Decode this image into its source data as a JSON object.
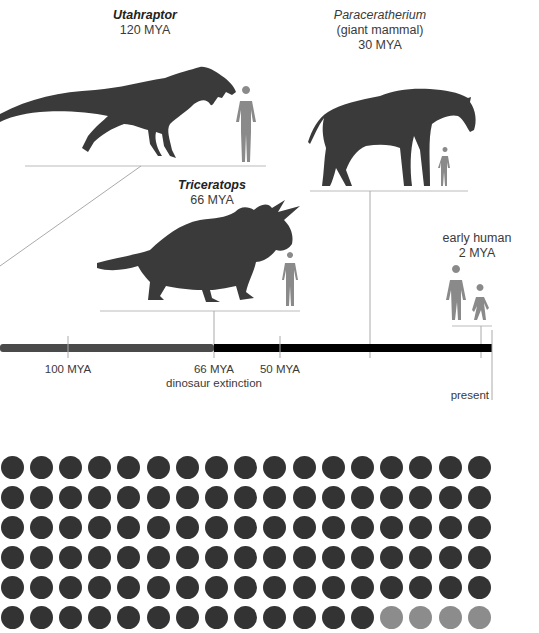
{
  "creatures": [
    {
      "id": "utahraptor",
      "name": "Utahraptor",
      "subtitle": "",
      "age": "120 MYA",
      "style": "bold-italic"
    },
    {
      "id": "paraceratherium",
      "name": "Paraceratherium",
      "subtitle": "(giant mammal)",
      "age": "30 MYA",
      "style": "italic"
    },
    {
      "id": "triceratops",
      "name": "Triceratops",
      "subtitle": "",
      "age": "66 MYA",
      "style": "bold-italic"
    },
    {
      "id": "early-human",
      "name": "early human",
      "subtitle": "",
      "age": "2 MYA",
      "style": "normal"
    }
  ],
  "timeline": {
    "ticks": [
      {
        "label": "100 MYA",
        "x": 68
      },
      {
        "label": "66 MYA",
        "sublabel": "dinosaur extinction",
        "x": 214
      },
      {
        "label": "50 MYA",
        "x": 280
      }
    ],
    "present_label": "present",
    "colors": {
      "pre_extinction": "#4a4a4a",
      "post_extinction": "#000000"
    }
  },
  "dot_grid": {
    "columns": 17,
    "visible_rows": 6,
    "highlight_count_last_row": 4,
    "colors": {
      "dark": "#333333",
      "light": "#8c8c8c"
    }
  },
  "colors": {
    "silhouette": "#3a3a3a",
    "human_silhouette": "#8a8a8a",
    "line": "#b5b5b5"
  }
}
